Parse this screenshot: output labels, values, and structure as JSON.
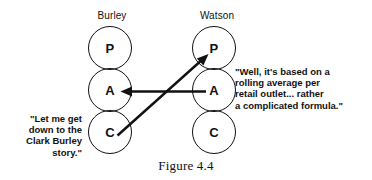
{
  "figure": {
    "caption": "Figure 4.4",
    "type": "transactional-analysis-pac-diagram"
  },
  "columns": [
    {
      "id": "burley",
      "label": "Burley",
      "states": [
        {
          "code": "P",
          "name": "parent"
        },
        {
          "code": "A",
          "name": "adult"
        },
        {
          "code": "C",
          "name": "child"
        }
      ]
    },
    {
      "id": "watson",
      "label": "Watson",
      "states": [
        {
          "code": "P",
          "name": "parent"
        },
        {
          "code": "A",
          "name": "adult"
        },
        {
          "code": "C",
          "name": "child"
        }
      ]
    }
  ],
  "speech": {
    "left": "\"Let me get\ndown to the\nClark Burley\nstory.\"",
    "right": "\"Well, it's based on a\nrolling average per\nretail outlet... rather\na complicated formula.\""
  },
  "arrows": [
    {
      "id": "watson-adult-to-burley-adult",
      "from": "watson.A",
      "to": "burley.A",
      "direction": "horizontal-left"
    },
    {
      "id": "burley-child-to-watson-parent",
      "from": "burley.C",
      "to": "watson.P",
      "direction": "diagonal-up-right"
    }
  ],
  "colors": {
    "ink": "#111111",
    "background": "#ffffff"
  }
}
